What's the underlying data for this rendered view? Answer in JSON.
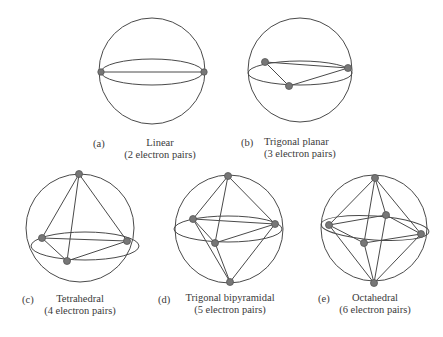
{
  "figure": {
    "panels": [
      {
        "letter": "(a)",
        "name": "Linear",
        "pairs": "(2 electron pairs)"
      },
      {
        "letter": "(b)",
        "name": "Trigonal planar",
        "pairs": "(3 electron pairs)"
      },
      {
        "letter": "(c)",
        "name": "Tetrahedral",
        "pairs": "(4 electron pairs)"
      },
      {
        "letter": "(d)",
        "name": "Trigonal bipyramidal",
        "pairs": "(5 electron pairs)"
      },
      {
        "letter": "(e)",
        "name": "Octahedral",
        "pairs": "(6 electron pairs)"
      }
    ],
    "colors": {
      "line": "#4a4a4a",
      "dot": "#777777"
    }
  }
}
